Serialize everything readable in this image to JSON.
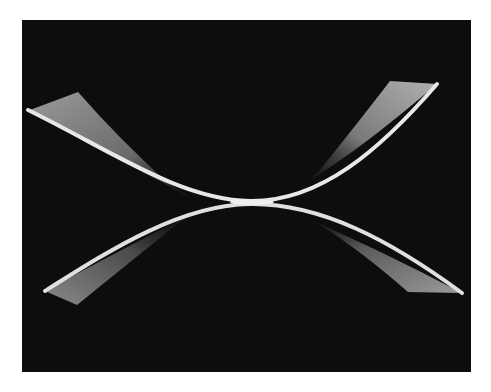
{
  "image": {
    "subject": "bent white strip forming saddle / X shape on black background",
    "background_color": "#0d0d0d",
    "border_color": "#ffffff",
    "strip_color": "#e6e6e6",
    "fin_color": "#8a8a8a"
  }
}
